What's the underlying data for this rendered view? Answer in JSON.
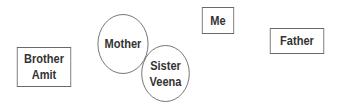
{
  "diagram": {
    "nodes": [
      {
        "id": "brother",
        "shape": "rect",
        "label": "Brother\nAmit"
      },
      {
        "id": "mother",
        "shape": "circle",
        "label": "Mother"
      },
      {
        "id": "sister",
        "shape": "circle",
        "label": "Sister\nVeena"
      },
      {
        "id": "me",
        "shape": "rect",
        "label": "Me"
      },
      {
        "id": "father",
        "shape": "rect",
        "label": "Father"
      }
    ],
    "colors": {
      "stroke": "#6a6a6a",
      "text": "#333333",
      "background": "#ffffff"
    }
  }
}
